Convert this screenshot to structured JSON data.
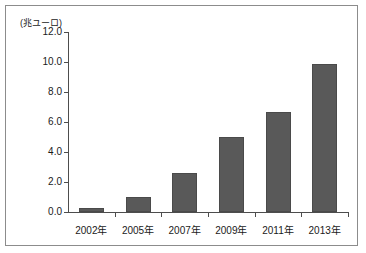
{
  "figure": {
    "unit_label": "(兆ユーロ)"
  },
  "chart_data": {
    "type": "bar",
    "title": "",
    "subtitle": "",
    "xlabel": "",
    "ylabel": "(兆ユーロ)",
    "categories": [
      "2002年",
      "2005年",
      "2007年",
      "2009年",
      "2011年",
      "2013年"
    ],
    "values": [
      0.3,
      1.0,
      2.6,
      5.0,
      6.7,
      9.9
    ],
    "ylim": [
      0.0,
      12.0
    ],
    "ytick_labels": [
      "0.0",
      "2.0",
      "4.0",
      "6.0",
      "8.0",
      "10.0",
      "12.0"
    ],
    "ytick_values": [
      0.0,
      2.0,
      4.0,
      6.0,
      8.0,
      10.0,
      12.0
    ],
    "grid": false,
    "legend": null,
    "bar_color": "#595959",
    "axis_color": "#4d4d4d",
    "background_color": "#ffffff"
  }
}
